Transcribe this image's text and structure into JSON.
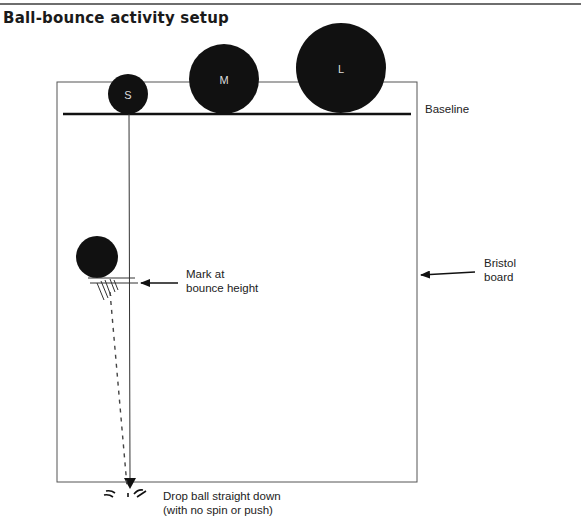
{
  "title": "Ball-bounce activity setup",
  "balls": [
    {
      "label": "S",
      "cx": 128,
      "cy": 95,
      "r": 20
    },
    {
      "label": "M",
      "cx": 224,
      "cy": 80,
      "r": 35
    },
    {
      "label": "L",
      "cx": 341,
      "cy": 69,
      "r": 45
    }
  ],
  "labels": {
    "baseline": "Baseline",
    "mark_line1": "Mark at",
    "mark_line2": "bounce height",
    "board_line1": "Bristol",
    "board_line2": "board",
    "drop_line1": "Drop ball straight down",
    "drop_line2": "(with no spin or push)"
  },
  "colors": {
    "ball": "#111111",
    "ball_label": "#dddddd",
    "board_outline": "#555555",
    "baseline": "#111111"
  }
}
